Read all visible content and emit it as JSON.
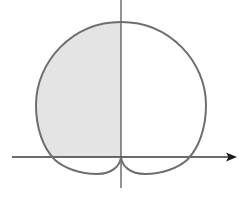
{
  "diagram": {
    "type": "polar-curve",
    "colors": {
      "curve": "#6e6e6e",
      "axes": "#3a3a3a",
      "shade": "#e4e4e4",
      "background": "#ffffff"
    },
    "axes": {
      "x_axis_arrow": true,
      "y_axis_arrow": false
    },
    "shaded_region": "left half of curve above x-axis (second quadrant)"
  }
}
